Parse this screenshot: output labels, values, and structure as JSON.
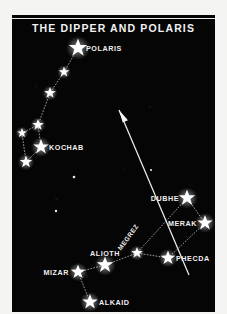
{
  "chart": {
    "title": "THE  DIPPER  AND  POLARIS",
    "plate_color": "#050505",
    "star_color": "#ffffff",
    "line_color": "#c8c8c8",
    "paper_color": "#f4f4f2"
  },
  "chart_data": {
    "type": "scatter",
    "title": "THE  DIPPER  AND  POLARIS",
    "xlabel": "",
    "ylabel": "",
    "xlim": [
      0,
      203
    ],
    "ylim": [
      0,
      297
    ],
    "grid": false,
    "legend": "none",
    "labeled_stars": [
      {
        "name": "POLARIS",
        "x": 66,
        "y": 33,
        "magnitude_size": 9.5,
        "label_side": "right"
      },
      {
        "name": "KOCHAB",
        "x": 29,
        "y": 132,
        "magnitude_size": 8.0,
        "label_side": "right"
      },
      {
        "name": "DUBHE",
        "x": 175,
        "y": 183,
        "magnitude_size": 8.5,
        "label_side": "left"
      },
      {
        "name": "MERAK",
        "x": 193,
        "y": 208,
        "magnitude_size": 8.0,
        "label_side": "left"
      },
      {
        "name": "MEGREZ",
        "x": 125,
        "y": 238,
        "magnitude_size": 6.0,
        "label_side": "angled"
      },
      {
        "name": "PHECDA",
        "x": 156,
        "y": 243,
        "magnitude_size": 7.5,
        "label_side": "right"
      },
      {
        "name": "ALIOTH",
        "x": 93,
        "y": 250,
        "magnitude_size": 8.5,
        "label_side": "above"
      },
      {
        "name": "MIZAR",
        "x": 66,
        "y": 257,
        "magnitude_size": 7.5,
        "label_side": "left"
      },
      {
        "name": "ALKAID",
        "x": 78,
        "y": 287,
        "magnitude_size": 8.0,
        "label_side": "right"
      }
    ],
    "unlabeled_stars": [
      {
        "x": 52,
        "y": 57,
        "magnitude_size": 5.5
      },
      {
        "x": 38,
        "y": 78,
        "magnitude_size": 6.0
      },
      {
        "x": 26,
        "y": 110,
        "magnitude_size": 6.0
      },
      {
        "x": 10,
        "y": 118,
        "magnitude_size": 5.0
      },
      {
        "x": 14,
        "y": 147,
        "magnitude_size": 6.5
      },
      {
        "x": 62,
        "y": 162,
        "magnitude_size": 2.2
      },
      {
        "x": 44,
        "y": 196,
        "magnitude_size": 2.0
      },
      {
        "x": 139,
        "y": 155,
        "magnitude_size": 1.8
      }
    ],
    "constellation_lines": [
      {
        "name": "ursa-minor-handle",
        "points": [
          [
            66,
            33
          ],
          [
            52,
            57
          ],
          [
            38,
            78
          ],
          [
            26,
            110
          ]
        ]
      },
      {
        "name": "ursa-minor-bowl",
        "points": [
          [
            26,
            110
          ],
          [
            29,
            132
          ],
          [
            14,
            147
          ],
          [
            10,
            118
          ],
          [
            26,
            110
          ]
        ]
      },
      {
        "name": "big-dipper-bowl",
        "points": [
          [
            175,
            183
          ],
          [
            193,
            208
          ],
          [
            156,
            243
          ],
          [
            125,
            238
          ],
          [
            175,
            183
          ]
        ]
      },
      {
        "name": "big-dipper-handle",
        "points": [
          [
            125,
            238
          ],
          [
            93,
            250
          ],
          [
            66,
            257
          ],
          [
            78,
            287
          ]
        ]
      }
    ],
    "pointer_arrow": {
      "label": "pointer-to-polaris",
      "from": [
        177,
        260
      ],
      "to": [
        107,
        95
      ],
      "description": "Arrow from the Big Dipper pointer stars aimed toward Polaris"
    }
  },
  "labels": {
    "polaris": "POLARIS",
    "kochab": "KOCHAB",
    "dubhe": "DUBHE",
    "merak": "MERAK",
    "megrez": "MEGREZ",
    "phecda": "PHECDA",
    "alioth": "ALIOTH",
    "mizar": "MIZAR",
    "alkaid": "ALKAID"
  }
}
